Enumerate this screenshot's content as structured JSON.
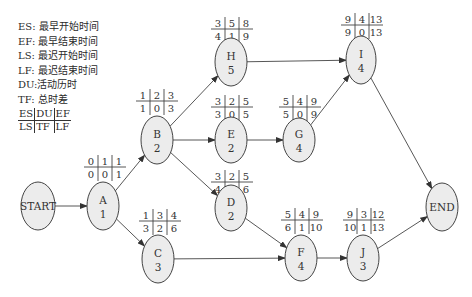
{
  "legend": {
    "items": [
      {
        "key": "ES",
        "desc": "最早开始时间"
      },
      {
        "key": "EF",
        "desc": "最早结束时间"
      },
      {
        "key": "LS",
        "desc": "最迟开始时间"
      },
      {
        "key": "LF",
        "desc": "最迟结束时间"
      },
      {
        "key": "DU",
        "desc": "活动历时"
      },
      {
        "key": "TF",
        "desc": "总时差"
      }
    ],
    "layout": {
      "top": [
        "ES",
        "DU",
        "EF"
      ],
      "bottom": [
        "LS",
        "TF",
        "LF"
      ]
    }
  },
  "nodes": [
    {
      "id": "START",
      "label": "START",
      "duration": ""
    },
    {
      "id": "A",
      "label": "A",
      "duration": "1",
      "ES": "0",
      "DU": "1",
      "EF": "1",
      "LS": "0",
      "TF": "0",
      "LF": "1"
    },
    {
      "id": "B",
      "label": "B",
      "duration": "2",
      "ES": "1",
      "DU": "2",
      "EF": "3",
      "LS": "1",
      "TF": "0",
      "LF": "3"
    },
    {
      "id": "C",
      "label": "C",
      "duration": "3",
      "ES": "1",
      "DU": "3",
      "EF": "4",
      "LS": "3",
      "TF": "2",
      "LF": "6"
    },
    {
      "id": "H",
      "label": "H",
      "duration": "5",
      "ES": "3",
      "DU": "5",
      "EF": "8",
      "LS": "4",
      "TF": "1",
      "LF": "9"
    },
    {
      "id": "E",
      "label": "E",
      "duration": "2",
      "ES": "3",
      "DU": "2",
      "EF": "5",
      "LS": "3",
      "TF": "0",
      "LF": "5"
    },
    {
      "id": "D",
      "label": "D",
      "duration": "2",
      "ES": "3",
      "DU": "2",
      "EF": "5",
      "LS": "4",
      "TF": "1",
      "LF": "6"
    },
    {
      "id": "G",
      "label": "G",
      "duration": "4",
      "ES": "5",
      "DU": "4",
      "EF": "9",
      "LS": "5",
      "TF": "0",
      "LF": "9"
    },
    {
      "id": "F",
      "label": "F",
      "duration": "4",
      "ES": "5",
      "DU": "4",
      "EF": "9",
      "LS": "6",
      "TF": "1",
      "LF": "10"
    },
    {
      "id": "I",
      "label": "I",
      "duration": "4",
      "ES": "9",
      "DU": "4",
      "EF": "13",
      "LS": "9",
      "TF": "0",
      "LF": "13"
    },
    {
      "id": "J",
      "label": "J",
      "duration": "3",
      "ES": "9",
      "DU": "3",
      "EF": "12",
      "LS": "10",
      "TF": "1",
      "LF": "13"
    },
    {
      "id": "END",
      "label": "END",
      "duration": ""
    }
  ],
  "edges": [
    [
      "START",
      "A"
    ],
    [
      "A",
      "B"
    ],
    [
      "A",
      "C"
    ],
    [
      "B",
      "H"
    ],
    [
      "B",
      "E"
    ],
    [
      "B",
      "D"
    ],
    [
      "C",
      "F"
    ],
    [
      "D",
      "F"
    ],
    [
      "E",
      "G"
    ],
    [
      "G",
      "I"
    ],
    [
      "H",
      "I"
    ],
    [
      "F",
      "J"
    ],
    [
      "I",
      "END"
    ],
    [
      "J",
      "END"
    ]
  ]
}
